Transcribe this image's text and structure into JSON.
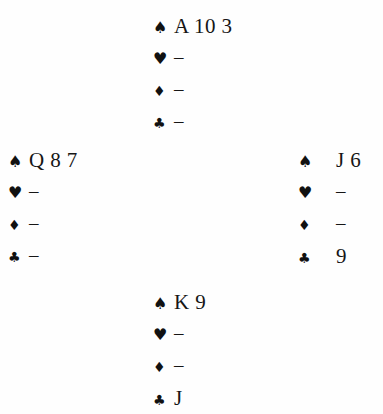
{
  "document": {
    "kind": "bridge-hand-diagram",
    "layout": "compass-cross",
    "background_color": "#fefefe",
    "text_color": "#161616",
    "suit_color": "#111111"
  },
  "suits": {
    "spade": {
      "symbol": "♠",
      "name": "spades"
    },
    "heart": {
      "symbol": "♥",
      "name": "hearts"
    },
    "diamond": {
      "symbol": "♦",
      "name": "diamonds"
    },
    "club": {
      "symbol": "♣",
      "name": "clubs"
    }
  },
  "void_marker": "–",
  "hands": {
    "north": {
      "position": "North",
      "spades": "A 10 3",
      "hearts": "–",
      "diamonds": "–",
      "clubs": "–"
    },
    "west": {
      "position": "West",
      "spades": "Q 8 7",
      "hearts": "–",
      "diamonds": "–",
      "clubs": "–"
    },
    "east": {
      "position": "East",
      "spades": "J 6",
      "hearts": "–",
      "diamonds": "–",
      "clubs": "9"
    },
    "south": {
      "position": "South",
      "spades": "K 9",
      "hearts": "–",
      "diamonds": "–",
      "clubs": "J"
    }
  }
}
